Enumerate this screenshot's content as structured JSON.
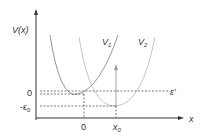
{
  "diagram": {
    "y_axis_label": "V(x)",
    "x_axis_label": "x",
    "curve1_label": "V",
    "curve1_sub": "1",
    "curve2_label": "V",
    "curve2_sub": "2",
    "energy_label": "ε′",
    "y_tick_zero": "0",
    "y_tick_neg": "-ε",
    "y_tick_neg_sub": "0",
    "x_tick_zero": "0",
    "x_tick_x0": "x",
    "x_tick_x0_sub": "0",
    "colors": {
      "axis": "#333333",
      "curve1": "#8a8a8a",
      "curve2": "#bdbdbd",
      "dashed": "#444444"
    }
  }
}
